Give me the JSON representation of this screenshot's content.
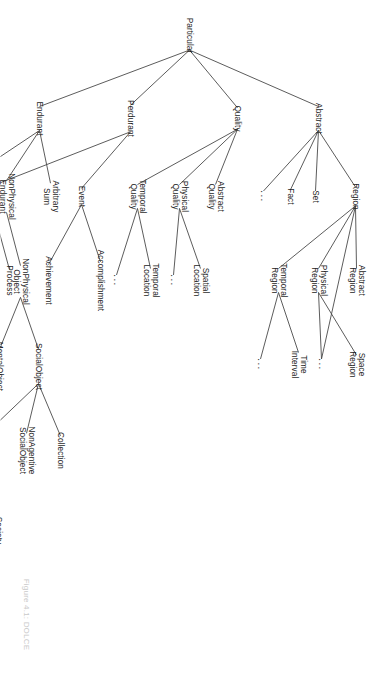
{
  "figure": {
    "caption": "Figure 4.1: DOLCE",
    "root_label": "Particular",
    "orientation_degrees": 90,
    "edge_color": "#4a4a4a",
    "text_color": "#1c1c1c",
    "background_color": "#ffffff"
  },
  "chart_data": {
    "type": "diagram",
    "title": "Figure 4.1: DOLCE",
    "subtype": "taxonomy-tree",
    "root": "Particular",
    "nodes": [
      {
        "id": "particular",
        "label": "Particular",
        "x": 35,
        "y": 189,
        "depth": 0
      },
      {
        "id": "abstract",
        "label": "Abstract",
        "x": 118,
        "y": 60,
        "depth": 1
      },
      {
        "id": "quality",
        "label": "Quality",
        "x": 118,
        "y": 141,
        "depth": 1
      },
      {
        "id": "perdurant",
        "label": "Perdurant",
        "x": 118,
        "y": 248,
        "depth": 1
      },
      {
        "id": "endurant",
        "label": "Endurant",
        "x": 118,
        "y": 339,
        "depth": 1
      },
      {
        "id": "region",
        "label": "Region",
        "x": 196,
        "y": 23,
        "depth": 2
      },
      {
        "id": "set",
        "label": "Set",
        "x": 196,
        "y": 63,
        "depth": 2
      },
      {
        "id": "fact",
        "label": "Fact",
        "x": 196,
        "y": 88,
        "depth": 2
      },
      {
        "id": "abstract-dots",
        "label": "...",
        "x": 196,
        "y": 115,
        "depth": 2
      },
      {
        "id": "abstract-region",
        "label": "Abstract\nRegion",
        "x": 280,
        "y": 22,
        "depth": 3
      },
      {
        "id": "physical-region",
        "label": "Physical\nRegion",
        "x": 280,
        "y": 60,
        "depth": 3
      },
      {
        "id": "temporal-region",
        "label": "Temporal\nRegion",
        "x": 280,
        "y": 100,
        "depth": 3
      },
      {
        "id": "space-region",
        "label": "Space\nRegion",
        "x": 364,
        "y": 22,
        "depth": 4
      },
      {
        "id": "region-dots",
        "label": "...",
        "x": 364,
        "y": 57,
        "depth": 4
      },
      {
        "id": "time-interval",
        "label": "Time\nInterval",
        "x": 364,
        "y": 80,
        "depth": 4
      },
      {
        "id": "temporal-region-dots",
        "label": "...",
        "x": 364,
        "y": 118,
        "depth": 4
      },
      {
        "id": "abstract-quality",
        "label": "Abstract\nQuality",
        "x": 196,
        "y": 163,
        "depth": 2
      },
      {
        "id": "physical-quality",
        "label": "Physical\nQuality",
        "x": 196,
        "y": 199,
        "depth": 2
      },
      {
        "id": "temporal-quality",
        "label": "Temporal\nQuality",
        "x": 196,
        "y": 241,
        "depth": 2
      },
      {
        "id": "spatial-location",
        "label": "Spatial\nLocation",
        "x": 280,
        "y": 178,
        "depth": 3
      },
      {
        "id": "physical-quality-dots",
        "label": "...",
        "x": 280,
        "y": 205,
        "depth": 3
      },
      {
        "id": "temporal-location",
        "label": "Temporal\nLocation",
        "x": 280,
        "y": 228,
        "depth": 3
      },
      {
        "id": "temporal-quality-dots",
        "label": "...",
        "x": 280,
        "y": 262,
        "depth": 3
      },
      {
        "id": "event",
        "label": "Event",
        "x": 196,
        "y": 297,
        "depth": 2
      },
      {
        "id": "stative",
        "label": "Stative",
        "x": 196,
        "y": 386,
        "depth": 2
      },
      {
        "id": "accomplishment",
        "label": "Accomplishment",
        "x": 280,
        "y": 278,
        "depth": 3
      },
      {
        "id": "achievement",
        "label": "Achievement",
        "x": 280,
        "y": 330,
        "depth": 3
      },
      {
        "id": "process",
        "label": "Process",
        "x": 280,
        "y": 369,
        "depth": 3
      },
      {
        "id": "state",
        "label": "State",
        "x": 280,
        "y": 412,
        "depth": 3
      },
      {
        "id": "arbitrary-sum",
        "label": "Arbitrary\nSum",
        "x": 196,
        "y": 328,
        "depth": 2
      },
      {
        "id": "nonphysical-endurant",
        "label": "NonPhysical\nEndurant",
        "x": 196,
        "y": 372,
        "depth": 2
      },
      {
        "id": "physical-endurant",
        "label": "Physical\nEndurant",
        "x": 196,
        "y": 420,
        "depth": 2
      },
      {
        "id": "nonphysical-object",
        "label": "NonPhysical\nObject",
        "x": 281,
        "y": 358,
        "depth": 3
      },
      {
        "id": "feature",
        "label": "Feature",
        "x": 281,
        "y": 400,
        "depth": 3
      },
      {
        "id": "physical-object",
        "label": "Physical\nObject",
        "x": 281,
        "y": 424,
        "depth": 3
      },
      {
        "id": "amountof-matter",
        "label": "AmountOf\nMatter",
        "x": 281,
        "y": 460,
        "depth": 3
      },
      {
        "id": "socialobject",
        "label": "SocialObject",
        "x": 366,
        "y": 340,
        "depth": 4
      },
      {
        "id": "mentalobject",
        "label": "MentalObject",
        "x": 366,
        "y": 379,
        "depth": 4
      },
      {
        "id": "nonagentive-physical-object",
        "label": "NonAgentive\nPhysical\nObject",
        "x": 366,
        "y": 422,
        "depth": 4
      },
      {
        "id": "agentive-physical-object",
        "label": "Agentive\nPhysical\nObject",
        "x": 366,
        "y": 466,
        "depth": 4
      },
      {
        "id": "collection",
        "label": "Collection",
        "x": 450,
        "y": 318,
        "depth": 5
      },
      {
        "id": "nonagentive-socialobject",
        "label": "NonAgentive\nSocialObject",
        "x": 450,
        "y": 352,
        "depth": 5
      },
      {
        "id": "agentive-socialobject",
        "label": "Agentive\nSocialObject",
        "x": 450,
        "y": 392,
        "depth": 5
      },
      {
        "id": "material-artifact",
        "label": "Material\nArtifact",
        "x": 450,
        "y": 437,
        "depth": 5
      },
      {
        "id": "society",
        "label": "Society",
        "x": 530,
        "y": 380,
        "depth": 6
      },
      {
        "id": "socialagent",
        "label": "SocialAgent",
        "x": 530,
        "y": 416,
        "depth": 6
      }
    ],
    "edges": [
      [
        "particular",
        "abstract"
      ],
      [
        "particular",
        "quality"
      ],
      [
        "particular",
        "perdurant"
      ],
      [
        "particular",
        "endurant"
      ],
      [
        "abstract",
        "region"
      ],
      [
        "abstract",
        "set"
      ],
      [
        "abstract",
        "fact"
      ],
      [
        "abstract",
        "abstract-dots"
      ],
      [
        "region",
        "abstract-region"
      ],
      [
        "region",
        "physical-region"
      ],
      [
        "region",
        "temporal-region"
      ],
      [
        "region",
        "region-dots"
      ],
      [
        "physical-region",
        "space-region"
      ],
      [
        "physical-region",
        "region-dots"
      ],
      [
        "temporal-region",
        "time-interval"
      ],
      [
        "temporal-region",
        "temporal-region-dots"
      ],
      [
        "quality",
        "abstract-quality"
      ],
      [
        "quality",
        "physical-quality"
      ],
      [
        "quality",
        "temporal-quality"
      ],
      [
        "physical-quality",
        "spatial-location"
      ],
      [
        "physical-quality",
        "physical-quality-dots"
      ],
      [
        "temporal-quality",
        "temporal-location"
      ],
      [
        "temporal-quality",
        "temporal-quality-dots"
      ],
      [
        "perdurant",
        "event"
      ],
      [
        "perdurant",
        "stative"
      ],
      [
        "event",
        "accomplishment"
      ],
      [
        "event",
        "achievement"
      ],
      [
        "stative",
        "process"
      ],
      [
        "stative",
        "state"
      ],
      [
        "endurant",
        "arbitrary-sum"
      ],
      [
        "endurant",
        "nonphysical-endurant"
      ],
      [
        "endurant",
        "physical-endurant"
      ],
      [
        "nonphysical-endurant",
        "nonphysical-object"
      ],
      [
        "physical-endurant",
        "feature"
      ],
      [
        "physical-endurant",
        "physical-object"
      ],
      [
        "physical-endurant",
        "amountof-matter"
      ],
      [
        "nonphysical-object",
        "socialobject"
      ],
      [
        "nonphysical-object",
        "mentalobject"
      ],
      [
        "physical-object",
        "nonagentive-physical-object"
      ],
      [
        "physical-object",
        "agentive-physical-object"
      ],
      [
        "socialobject",
        "collection"
      ],
      [
        "socialobject",
        "nonagentive-socialobject"
      ],
      [
        "socialobject",
        "agentive-socialobject"
      ],
      [
        "nonagentive-physical-object",
        "material-artifact"
      ],
      [
        "agentive-socialobject",
        "society"
      ],
      [
        "agentive-socialobject",
        "socialagent"
      ]
    ]
  }
}
